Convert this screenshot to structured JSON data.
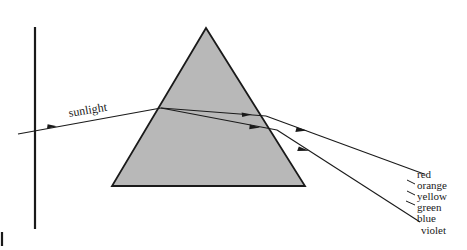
{
  "figure": {
    "background_color": "#ffffff",
    "line_color": "#1a1a1a",
    "prism_fill_color": "#b8b8b8",
    "prism_stroke_color": "#1a1a1a"
  },
  "labels": {
    "incident_beam": "sunlight"
  },
  "spectrum": [
    {
      "name": "red",
      "label": "red"
    },
    {
      "name": "orange",
      "label": "orange"
    },
    {
      "name": "yellow",
      "label": "yellow"
    },
    {
      "name": "green",
      "label": "green"
    },
    {
      "name": "blue",
      "label": "blue"
    },
    {
      "name": "violet",
      "label": "violet"
    }
  ],
  "elements": {
    "screen_line": "vertical-screen",
    "prism": "triangular-prism",
    "incident_ray": "incident-sunlight-ray",
    "internal_rays": "refracted-rays-inside-prism",
    "exit_rays": "dispersed-exit-rays",
    "corner_mark": "page-corner-mark"
  }
}
